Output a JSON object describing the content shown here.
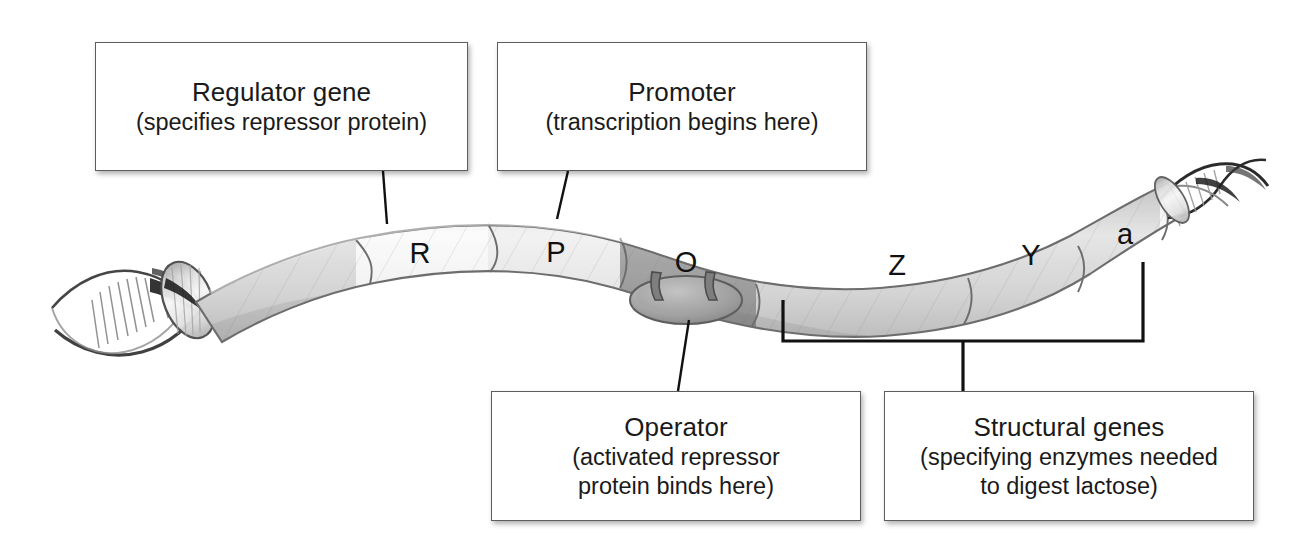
{
  "figure": {
    "background_color": "#ffffff"
  },
  "dna": {
    "strand_label": "dna-double-helix",
    "segments": [
      {
        "id": "R",
        "label": "R",
        "name": "regulator-gene-segment",
        "shade": "light",
        "cx": 420,
        "cy": 253
      },
      {
        "id": "P",
        "label": "P",
        "name": "promoter-segment",
        "shade": "medium",
        "cx": 556,
        "cy": 252
      },
      {
        "id": "O",
        "label": "O",
        "name": "operator-segment",
        "shade": "dark",
        "cx": 686,
        "cy": 262
      },
      {
        "id": "Z",
        "label": "Z",
        "name": "structural-gene-z",
        "shade": "medium",
        "cx": 897,
        "cy": 265
      },
      {
        "id": "Y",
        "label": "Y",
        "name": "structural-gene-y",
        "shade": "medium",
        "cx": 1031,
        "cy": 255
      },
      {
        "id": "a",
        "label": "a",
        "name": "structural-gene-a",
        "shade": "medium",
        "cx": 1125,
        "cy": 234
      }
    ]
  },
  "callouts": {
    "regulator": {
      "name": "regulator-gene-callout",
      "title": "Regulator gene",
      "subtitle": "(specifies repressor protein)"
    },
    "promoter": {
      "name": "promoter-callout",
      "title": "Promoter",
      "subtitle": "(transcription begins here)"
    },
    "operator": {
      "name": "operator-callout",
      "title": "Operator",
      "subtitle_line1": "(activated repressor",
      "subtitle_line2": "protein binds here)"
    },
    "structural": {
      "name": "structural-genes-callout",
      "title": "Structural genes",
      "subtitle_line1": "(specifying enzymes needed",
      "subtitle_line2": "to digest lactose)"
    }
  },
  "colors": {
    "box_border": "#5d5d5d",
    "leader_line": "#111111",
    "text": "#1a1a1a",
    "tube_light": "#f2f2f2",
    "tube_medium": "#c9c9c9",
    "tube_dark": "#8f8f8f",
    "tube_outline": "#6f6f6f"
  }
}
